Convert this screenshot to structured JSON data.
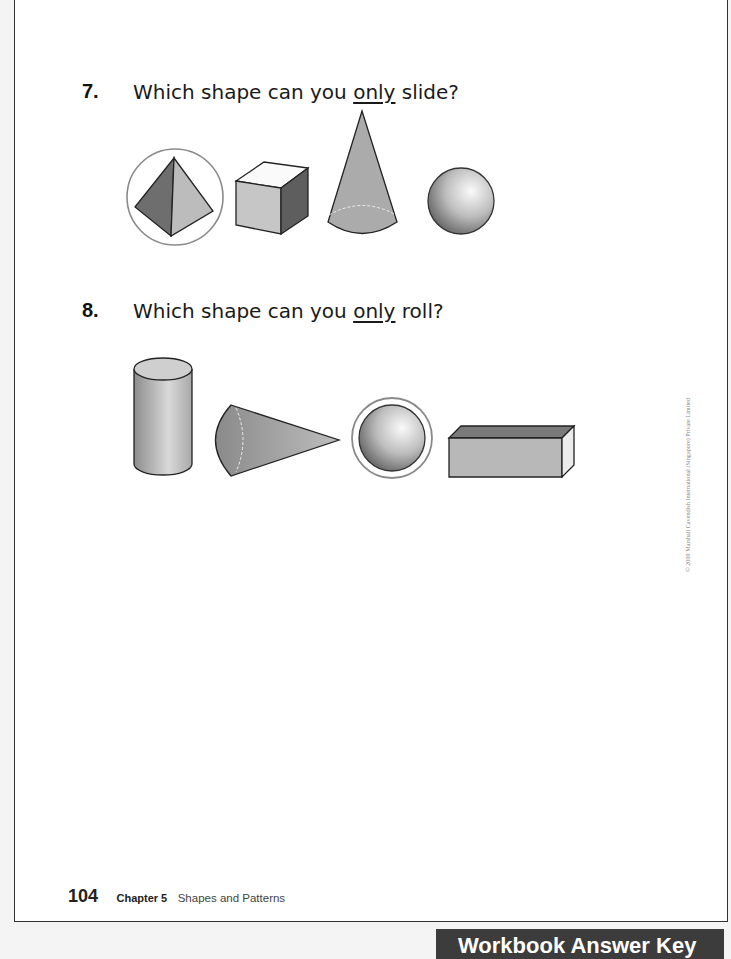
{
  "questions": [
    {
      "number": "7.",
      "text_before": "Which shape can you ",
      "emphasis": "only",
      "text_after": " slide?",
      "shapes": [
        "pyramid",
        "cube",
        "cone",
        "sphere"
      ],
      "circled_answer": "pyramid"
    },
    {
      "number": "8.",
      "text_before": "Which shape can you ",
      "emphasis": "only",
      "text_after": " roll?",
      "shapes": [
        "cylinder",
        "cone",
        "sphere",
        "rectangular-prism"
      ],
      "circled_answer": "sphere"
    }
  ],
  "footer": {
    "page_number": "104",
    "chapter": "Chapter 5",
    "chapter_title": "Shapes and Patterns"
  },
  "copyright": "© 2009 Marshall Cavendish International (Singapore) Private Limited",
  "bottom_tab": "Workbook Answer Key",
  "colors": {
    "circle_stroke": "#8a8a8a",
    "shape_fill_light": "#cfcfcf",
    "shape_fill_dark": "#6e6e6e",
    "tab_bg": "#3c3c3c"
  }
}
